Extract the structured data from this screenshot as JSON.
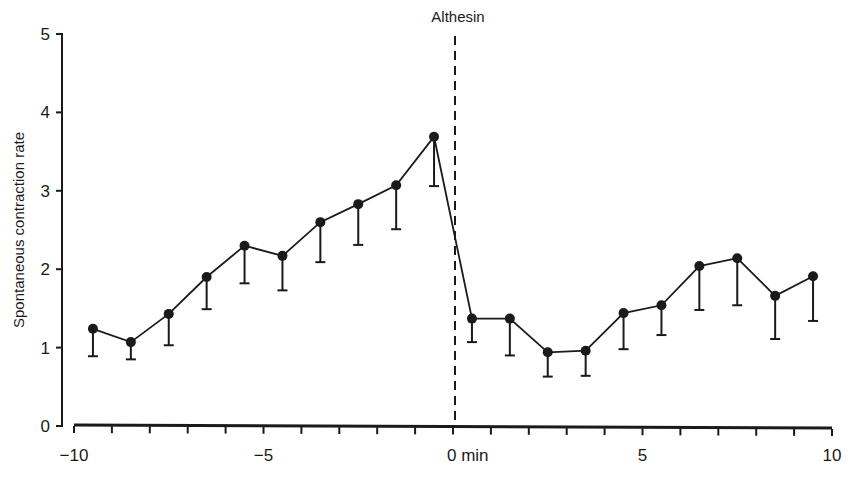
{
  "chart_data": {
    "type": "line",
    "title": "",
    "xlabel": "min",
    "ylabel": "Spontaneous contraction rate",
    "xlim": [
      -10,
      10
    ],
    "ylim": [
      0,
      5
    ],
    "grid": false,
    "legend": null,
    "x_ticks": [
      -10,
      -5,
      0,
      5,
      10
    ],
    "x_tick_labels": [
      "−10",
      "−5",
      "0 min",
      "5",
      "10"
    ],
    "x_minor_tick_step": 1,
    "y_ticks": [
      0,
      1,
      2,
      3,
      4,
      5
    ],
    "y_tick_labels": [
      "0",
      "1",
      "2",
      "3",
      "4",
      "5"
    ],
    "annotations": [
      {
        "text": "Althesin",
        "x": 0,
        "style": "dashed vertical line marking drug administration"
      }
    ],
    "series": [
      {
        "name": "Spontaneous contraction rate",
        "error_bars": "lower (SEM)",
        "x": [
          -9.5,
          -8.5,
          -7.5,
          -6.5,
          -5.5,
          -4.5,
          -3.5,
          -2.5,
          -1.5,
          -0.5,
          0.5,
          1.5,
          2.5,
          3.5,
          4.5,
          5.5,
          6.5,
          7.5,
          8.5,
          9.5
        ],
        "values": [
          1.24,
          1.07,
          1.43,
          1.9,
          2.3,
          2.17,
          2.6,
          2.83,
          3.07,
          3.69,
          1.37,
          1.37,
          0.94,
          0.96,
          1.44,
          1.54,
          2.04,
          2.14,
          1.66,
          1.91
        ],
        "lower": [
          0.89,
          0.85,
          1.03,
          1.49,
          1.82,
          1.73,
          2.09,
          2.31,
          2.51,
          3.06,
          1.07,
          0.9,
          0.63,
          0.64,
          0.98,
          1.16,
          1.48,
          1.54,
          1.11,
          1.34
        ]
      }
    ]
  },
  "labels": {
    "ylabel": "Spontaneous contraction rate",
    "annotation": "Althesin"
  },
  "colors": {
    "ink": "#1a1a1a",
    "background": "#ffffff"
  }
}
